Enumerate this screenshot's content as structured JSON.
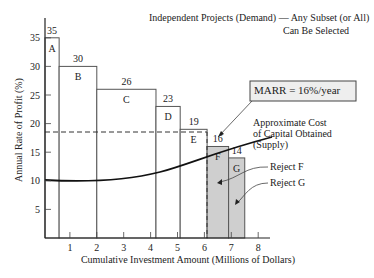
{
  "chart_data": {
    "type": "bar",
    "title_line1": "Independent Projects (Demand) — Any Subset (or All)",
    "title_line2": "Can Be Selected",
    "xlabel": "Cumulative Investment Amount (Millions of Dollars)",
    "ylabel": "Annual Rate of Profit (%)",
    "xlim": [
      0,
      8
    ],
    "ylim": [
      0,
      35
    ],
    "xticks": [
      "1",
      "2",
      "3",
      "4",
      "5",
      "6",
      "7",
      "8"
    ],
    "yticks": [
      "5",
      "10",
      "15",
      "20",
      "25",
      "30",
      "35"
    ],
    "grid": false,
    "projects": [
      {
        "label": "A",
        "rate": 35,
        "x_start": 0.0,
        "x_end": 0.6,
        "rejected": false
      },
      {
        "label": "B",
        "rate": 30,
        "x_start": 0.6,
        "x_end": 2.0,
        "rejected": false
      },
      {
        "label": "C",
        "rate": 26,
        "x_start": 2.0,
        "x_end": 4.2,
        "rejected": false
      },
      {
        "label": "D",
        "rate": 23,
        "x_start": 4.2,
        "x_end": 5.1,
        "rejected": false
      },
      {
        "label": "E",
        "rate": 19,
        "x_start": 5.1,
        "x_end": 6.1,
        "rejected": false
      },
      {
        "label": "F",
        "rate": 16,
        "x_start": 6.1,
        "x_end": 6.9,
        "rejected": true
      },
      {
        "label": "G",
        "rate": 14,
        "x_start": 6.9,
        "x_end": 7.5,
        "rejected": true
      }
    ],
    "categories": [
      "A",
      "B",
      "C",
      "D",
      "E",
      "F",
      "G"
    ],
    "values": [
      35,
      30,
      26,
      23,
      19,
      16,
      14
    ],
    "marr_line": {
      "value": 18.5,
      "style": "dashed",
      "label": "MARR = 16%/year"
    },
    "supply_curve": {
      "label_line1": "Approximate Cost",
      "label_line2": "of Capital Obtained",
      "label_line3": "(Supply)",
      "points": [
        [
          0,
          10
        ],
        [
          1,
          9.9
        ],
        [
          2,
          10
        ],
        [
          3,
          10.5
        ],
        [
          4,
          11.4
        ],
        [
          5,
          12.8
        ],
        [
          6,
          14.8
        ],
        [
          7,
          16.7
        ]
      ]
    },
    "annotations": [
      "Reject F",
      "Reject G"
    ],
    "colors": {
      "rejected_fill": "#cfcfcf",
      "line": "#222222",
      "bar_stroke": "#555555"
    }
  },
  "labels": {
    "title_line1": "Independent Projects (Demand) — Any Subset (or All)",
    "title_line2": "Can Be Selected",
    "xlabel": "Cumulative Investment Amount (Millions of Dollars)",
    "ylabel": "Annual Rate of Profit (%)",
    "marr": "MARR = 16%/year",
    "supply1": "Approximate Cost",
    "supply2": "of Capital Obtained",
    "supply3": "(Supply)",
    "reject_f": "Reject F",
    "reject_g": "Reject G"
  }
}
